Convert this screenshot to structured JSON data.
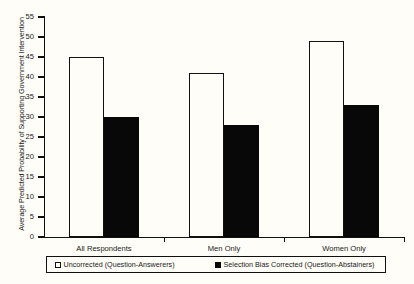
{
  "chart_data": {
    "type": "bar",
    "title": "",
    "subtitle": "",
    "xlabel": "",
    "ylabel": "Average Predicted Probability of Supporting Government Intervention",
    "categories": [
      "All Respondents",
      "Men Only",
      "Women Only"
    ],
    "series": [
      {
        "name": "Uncorrected (Question-Answerers)",
        "style": "open",
        "color": "#ffffff",
        "edge_color": "#111111",
        "values": [
          45,
          41,
          49
        ]
      },
      {
        "name": "Selection Bias Corrected (Question-Abstainers)",
        "style": "filled",
        "color": "#080808",
        "edge_color": "#080808",
        "values": [
          30,
          28,
          33
        ]
      }
    ],
    "ylim": [
      0,
      55
    ],
    "ytick_values": [
      0,
      5,
      10,
      15,
      20,
      25,
      30,
      35,
      40,
      45,
      50,
      55
    ],
    "ytick_labels": [
      "0",
      "5",
      "10",
      "15",
      "20",
      "25",
      "30",
      "35",
      "40",
      "45",
      "50",
      "55"
    ],
    "grid": false,
    "legend_position": "bottom",
    "legend_border": true,
    "background_color": "#fffdf7",
    "axis_color": "#111111"
  },
  "legend": {
    "entries": [
      {
        "label": "Uncorrected (Question-Answerers)",
        "swatch": "open-square-icon"
      },
      {
        "label": "Selection Bias Corrected (Question-Abstainers)",
        "swatch": "filled-square-icon"
      }
    ]
  }
}
